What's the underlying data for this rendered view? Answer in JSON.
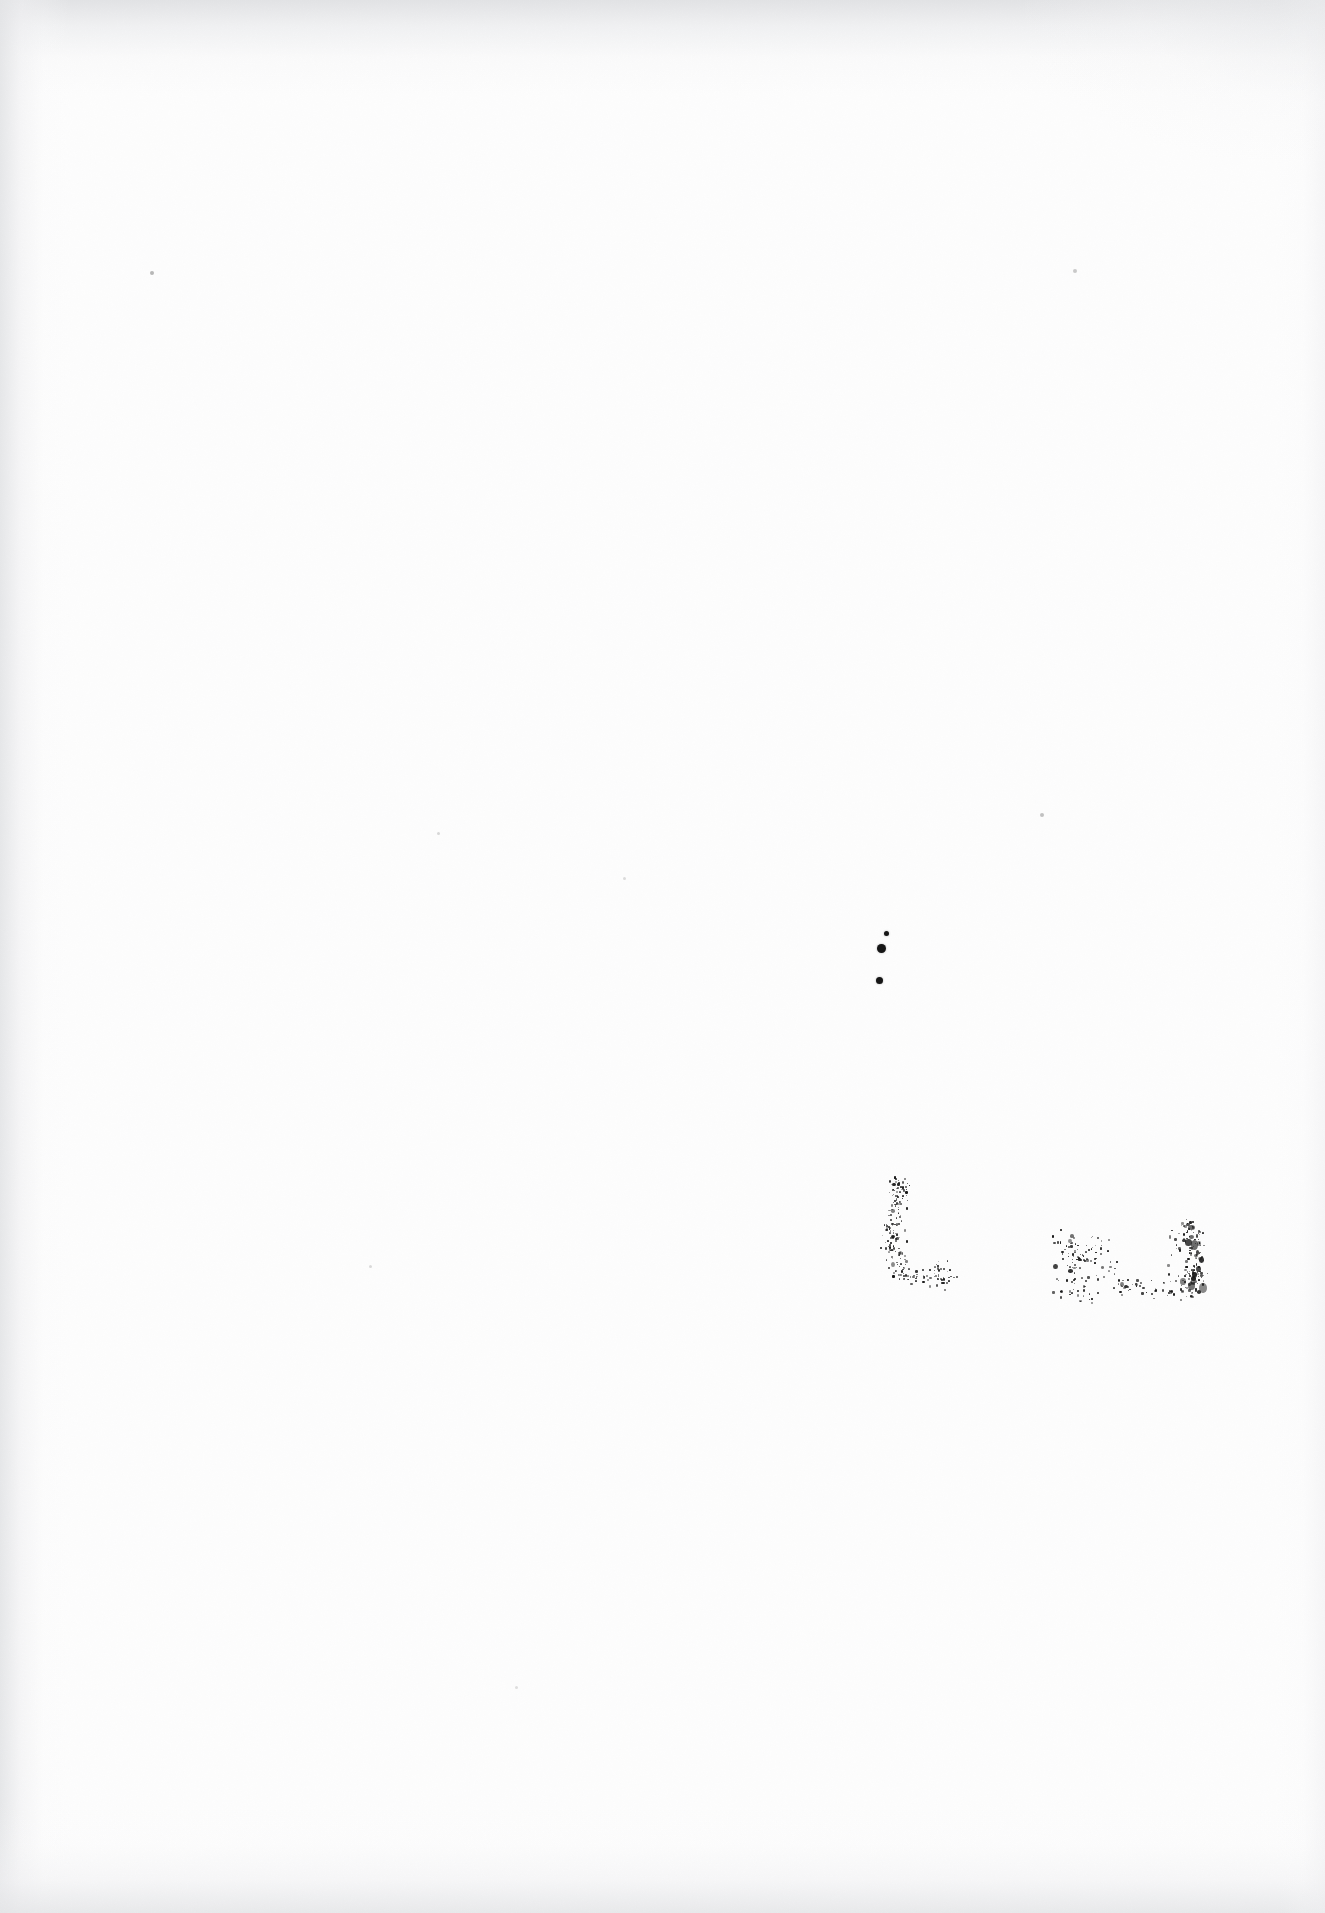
{
  "document": {
    "kind": "scanned-page",
    "page_content_text": "",
    "visible_text": "",
    "page_background_color": "#fdfdfd",
    "ink_color": "#161616",
    "edge_shadow_color": "#e4e5e7"
  },
  "marks": {
    "ink_dots": [
      {
        "name": "ink-dot-upper-small",
        "x": 884,
        "y": 931,
        "size": 5
      },
      {
        "name": "ink-dot-upper-large",
        "x": 877,
        "y": 944,
        "size": 9
      },
      {
        "name": "ink-dot-lower",
        "x": 876,
        "y": 977,
        "size": 7
      }
    ],
    "faint_specks": [
      {
        "name": "speck-top-left",
        "x": 150,
        "y": 271,
        "size": 4,
        "opacity": 0.3
      },
      {
        "name": "speck-top-right",
        "x": 1073,
        "y": 269,
        "size": 4,
        "opacity": 0.22
      },
      {
        "name": "speck-mid-right",
        "x": 1040,
        "y": 813,
        "size": 4,
        "opacity": 0.26
      },
      {
        "name": "speck-mid-left",
        "x": 437,
        "y": 832,
        "size": 3,
        "opacity": 0.16
      },
      {
        "name": "speck-center",
        "x": 623,
        "y": 877,
        "size": 3,
        "opacity": 0.14
      },
      {
        "name": "speck-lower-left",
        "x": 369,
        "y": 1265,
        "size": 3,
        "opacity": 0.15
      },
      {
        "name": "speck-bottom-center",
        "x": 515,
        "y": 1686,
        "size": 3,
        "opacity": 0.13
      }
    ],
    "stamp_clusters": [
      {
        "name": "stamp-mark-letter-l",
        "description": "degraded L-shaped ink stamp",
        "x": 876,
        "y": 1180,
        "width": 95,
        "height": 115,
        "density": 210,
        "seed": 1337,
        "strokes": [
          {
            "x0": 0.18,
            "y0": 0.02,
            "x1": 0.3,
            "y1": 0.08,
            "spread": 0.09,
            "weight": 0.55
          },
          {
            "x0": 0.22,
            "y0": 0.06,
            "x1": 0.2,
            "y1": 0.34,
            "spread": 0.1,
            "weight": 0.85
          },
          {
            "x0": 0.16,
            "y0": 0.34,
            "x1": 0.17,
            "y1": 0.62,
            "spread": 0.11,
            "weight": 1.0
          },
          {
            "x0": 0.15,
            "y0": 0.6,
            "x1": 0.3,
            "y1": 0.78,
            "spread": 0.1,
            "weight": 0.6
          },
          {
            "x0": 0.22,
            "y0": 0.8,
            "x1": 0.72,
            "y1": 0.88,
            "spread": 0.08,
            "weight": 0.95
          },
          {
            "x0": 0.6,
            "y0": 0.72,
            "x1": 0.78,
            "y1": 0.86,
            "spread": 0.07,
            "weight": 0.45
          }
        ]
      },
      {
        "name": "stamp-mark-illegible-word",
        "description": "illegible dense ink blot cluster resembling a stamped word",
        "x": 1056,
        "y": 1210,
        "width": 150,
        "height": 90,
        "density": 300,
        "seed": 4242,
        "strokes": [
          {
            "x0": 0.03,
            "y0": 0.22,
            "x1": 0.07,
            "y1": 0.95,
            "spread": 0.09,
            "weight": 1.0
          },
          {
            "x0": 0.07,
            "y0": 0.35,
            "x1": 0.22,
            "y1": 0.6,
            "spread": 0.1,
            "weight": 0.8
          },
          {
            "x0": 0.12,
            "y0": 0.55,
            "x1": 0.2,
            "y1": 0.98,
            "spread": 0.09,
            "weight": 0.9
          },
          {
            "x0": 0.26,
            "y0": 0.3,
            "x1": 0.36,
            "y1": 0.68,
            "spread": 0.1,
            "weight": 0.55
          },
          {
            "x0": 0.34,
            "y0": 0.62,
            "x1": 0.48,
            "y1": 0.93,
            "spread": 0.09,
            "weight": 0.65
          },
          {
            "x0": 0.5,
            "y0": 0.78,
            "x1": 0.62,
            "y1": 0.92,
            "spread": 0.07,
            "weight": 0.4
          },
          {
            "x0": 0.66,
            "y0": 0.8,
            "x1": 0.76,
            "y1": 0.95,
            "spread": 0.07,
            "weight": 0.45
          },
          {
            "x0": 0.8,
            "y0": 0.18,
            "x1": 0.84,
            "y1": 0.95,
            "spread": 0.08,
            "weight": 0.75
          },
          {
            "x0": 0.88,
            "y0": 0.12,
            "x1": 0.93,
            "y1": 0.4,
            "spread": 0.06,
            "weight": 1.2
          },
          {
            "x0": 0.9,
            "y0": 0.4,
            "x1": 0.94,
            "y1": 0.78,
            "spread": 0.06,
            "weight": 1.3
          },
          {
            "x0": 0.86,
            "y0": 0.7,
            "x1": 0.92,
            "y1": 0.96,
            "spread": 0.06,
            "weight": 1.1
          }
        ]
      }
    ]
  }
}
